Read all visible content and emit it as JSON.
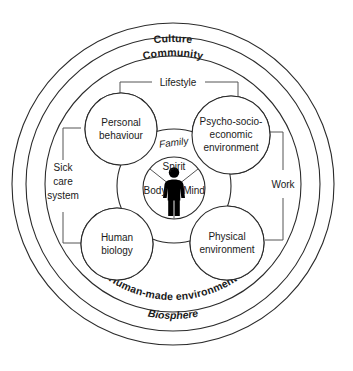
{
  "diagram": {
    "background_color": "#ffffff",
    "stroke_color": "#2b2b2b",
    "figure_color": "#000000"
  },
  "rings": [
    {
      "id": "culture",
      "label": "Culture",
      "style": "bold",
      "position": "top"
    },
    {
      "id": "community",
      "label": "Community",
      "style": "bold",
      "position": "top"
    },
    {
      "id": "human-made-environment",
      "label": "Human-made environment",
      "style": "bold",
      "position": "bottom-curved"
    },
    {
      "id": "biosphere",
      "label": "Biosphere",
      "style": "bold-italic",
      "position": "bottom"
    }
  ],
  "nodes": [
    {
      "id": "personal-behaviour",
      "lines": [
        "Personal",
        "behaviour"
      ]
    },
    {
      "id": "psycho-socio-economic",
      "lines": [
        "Psycho-socio-",
        "economic",
        "environment"
      ]
    },
    {
      "id": "human-biology",
      "lines": [
        "Human",
        "biology"
      ]
    },
    {
      "id": "physical-environment",
      "lines": [
        "Physical",
        "environment"
      ]
    }
  ],
  "brackets": [
    {
      "id": "lifestyle",
      "label": "Lifestyle",
      "orientation": "horizontal-top"
    },
    {
      "id": "work",
      "label": "Work",
      "orientation": "vertical-right"
    },
    {
      "id": "sick-care-system",
      "label": "Sick\ncare\nsystem",
      "lines": [
        "Sick",
        "care",
        "system"
      ],
      "orientation": "vertical-left"
    }
  ],
  "center": {
    "family_label": "Family",
    "segments": [
      {
        "id": "spirit",
        "label": "Spirit"
      },
      {
        "id": "body",
        "label": "Body"
      },
      {
        "id": "mind",
        "label": "Mind"
      }
    ],
    "figure": "human-figure-pictogram"
  }
}
